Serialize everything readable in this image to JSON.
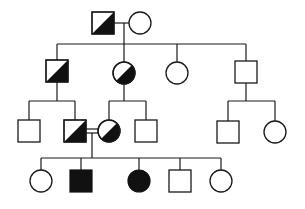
{
  "diagram": {
    "type": "pedigree",
    "colors": {
      "line": "#1a1a1a",
      "affected": "#111111",
      "unaffected": "#ffffff"
    },
    "generations": [
      {
        "label": "I",
        "individuals": [
          {
            "id": "I-1",
            "sex": "male",
            "status": "carrier"
          },
          {
            "id": "I-2",
            "sex": "female",
            "status": "unaffected"
          }
        ]
      },
      {
        "label": "II",
        "individuals": [
          {
            "id": "II-1",
            "sex": "male",
            "status": "carrier"
          },
          {
            "id": "II-2",
            "sex": "female",
            "status": "carrier"
          },
          {
            "id": "II-3",
            "sex": "female",
            "status": "unaffected"
          },
          {
            "id": "II-4",
            "sex": "male",
            "status": "unaffected"
          }
        ]
      },
      {
        "label": "III",
        "individuals": [
          {
            "id": "III-1",
            "sex": "male",
            "status": "unaffected"
          },
          {
            "id": "III-2",
            "sex": "male",
            "status": "carrier"
          },
          {
            "id": "III-3",
            "sex": "female",
            "status": "carrier"
          },
          {
            "id": "III-4",
            "sex": "male",
            "status": "unaffected"
          },
          {
            "id": "III-5",
            "sex": "male",
            "status": "unaffected"
          },
          {
            "id": "III-6",
            "sex": "female",
            "status": "unaffected"
          }
        ]
      },
      {
        "label": "IV",
        "individuals": [
          {
            "id": "IV-1",
            "sex": "female",
            "status": "unaffected"
          },
          {
            "id": "IV-2",
            "sex": "male",
            "status": "affected"
          },
          {
            "id": "IV-3",
            "sex": "female",
            "status": "affected"
          },
          {
            "id": "IV-4",
            "sex": "male",
            "status": "unaffected"
          },
          {
            "id": "IV-5",
            "sex": "female",
            "status": "unaffected"
          }
        ]
      }
    ],
    "matings": [
      {
        "partners": [
          "I-1",
          "I-2"
        ],
        "consanguineous": false
      },
      {
        "partners": [
          "III-2",
          "III-3"
        ],
        "consanguineous": true
      }
    ]
  }
}
